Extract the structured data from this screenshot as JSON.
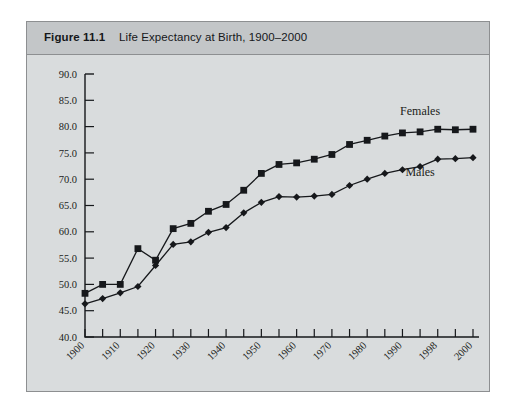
{
  "figure": {
    "number": "Figure 11.1",
    "title": "Life Expectancy at Birth, 1900–2000"
  },
  "chart_data": {
    "type": "line",
    "title": "Life Expectancy at Birth, 1900–2000",
    "xlabel": "",
    "ylabel": "",
    "ylim": [
      40.0,
      90.0
    ],
    "ytick_labels": [
      "90.0",
      "85.0",
      "80.0",
      "75.0",
      "70.0",
      "65.0",
      "60.0",
      "55.0",
      "50.0",
      "45.0",
      "40.0"
    ],
    "ytick_values": [
      90.0,
      85.0,
      80.0,
      75.0,
      70.0,
      65.0,
      60.0,
      55.0,
      50.0,
      45.0,
      40.0
    ],
    "grid": false,
    "legend_position": "inline-right",
    "x_tick_count": 23,
    "categories": [
      "1900",
      "1905",
      "1910",
      "1915",
      "1920",
      "1925",
      "1930",
      "1935",
      "1940",
      "1945",
      "1950",
      "1955",
      "1960",
      "1965",
      "1970",
      "1975",
      "1980",
      "1985",
      "1990",
      "1994",
      "1998",
      "1999",
      "2000"
    ],
    "xtick_labels": [
      "1900",
      "1910",
      "1920",
      "1930",
      "1940",
      "1950",
      "1960",
      "1970",
      "1980",
      "1990",
      "1998",
      "2000"
    ],
    "xtick_label_indices": [
      0,
      2,
      4,
      6,
      8,
      10,
      12,
      14,
      16,
      18,
      20,
      22
    ],
    "series": [
      {
        "name": "Females",
        "marker": "square",
        "values": [
          48.3,
          50.0,
          50.0,
          56.8,
          54.6,
          60.6,
          61.6,
          63.9,
          65.2,
          67.9,
          71.1,
          72.8,
          73.1,
          73.8,
          74.7,
          76.6,
          77.4,
          78.2,
          78.8,
          79.0,
          79.5,
          79.4,
          79.5
        ]
      },
      {
        "name": "Males",
        "marker": "diamond",
        "values": [
          46.3,
          47.3,
          48.4,
          49.6,
          53.6,
          57.6,
          58.1,
          59.9,
          60.8,
          63.6,
          65.6,
          66.7,
          66.6,
          66.8,
          67.1,
          68.8,
          70.0,
          71.1,
          71.8,
          72.4,
          73.8,
          73.9,
          74.1
        ]
      }
    ],
    "annotations": [
      {
        "text": "Females",
        "x_index": 19,
        "y": 82.2
      },
      {
        "text": "Males",
        "x_index": 19,
        "y": 70.6
      }
    ]
  }
}
